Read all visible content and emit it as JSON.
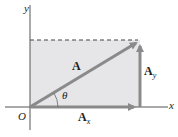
{
  "diagram": {
    "type": "vector-components",
    "axes": {
      "x_label": "x",
      "y_label": "y",
      "origin_label": "O"
    },
    "vector": {
      "label": "A",
      "angle_label": "θ"
    },
    "components": {
      "x_label": "A",
      "x_sub": "x",
      "y_label": "A",
      "y_sub": "y"
    },
    "colors": {
      "fill": "#e6e6e8",
      "vector": "#8a8a8a",
      "axis": "#555555",
      "dashed": "#444444"
    }
  }
}
